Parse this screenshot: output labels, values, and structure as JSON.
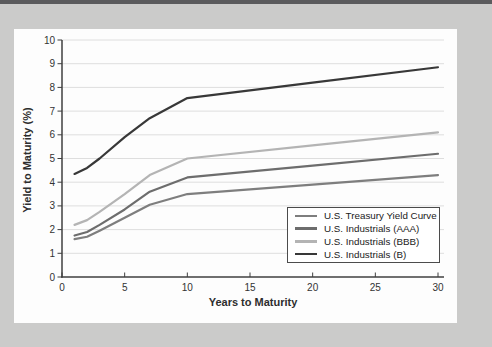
{
  "page": {
    "top_bar_color": "#5b5b5d",
    "background_color": "#cbcbca",
    "panel_color": "#fdfdfd"
  },
  "chart_data": {
    "type": "line",
    "xlabel": "Years to Maturity",
    "ylabel": "Yield to Maturity (%)",
    "xlim": [
      0,
      30
    ],
    "ylim": [
      0,
      10
    ],
    "xticks": [
      0,
      5,
      10,
      15,
      20,
      25,
      30
    ],
    "yticks": [
      0,
      1,
      2,
      3,
      4,
      5,
      6,
      7,
      8,
      9,
      10
    ],
    "grid": "horizontal-only",
    "grid_color": "#dedede",
    "axis_color": "#3f3f3f",
    "tick_label_color": "#333333",
    "legend_position": "inside-lower-right",
    "x": [
      1,
      2,
      3,
      5,
      7,
      10,
      20,
      30
    ],
    "series": [
      {
        "name": "U.S. Treasury Yield Curve",
        "color": "#7e7e7e",
        "values": [
          1.6,
          1.7,
          1.95,
          2.5,
          3.05,
          3.5,
          3.9,
          4.3
        ]
      },
      {
        "name": "U.S. Industrials (AAA)",
        "color": "#6d6d6d",
        "values": [
          1.75,
          1.9,
          2.2,
          2.85,
          3.6,
          4.2,
          4.7,
          5.2
        ]
      },
      {
        "name": "U.S. Industrials (BBB)",
        "color": "#b4b4b4",
        "values": [
          2.2,
          2.4,
          2.75,
          3.5,
          4.3,
          5.0,
          5.55,
          6.1
        ]
      },
      {
        "name": "U.S. Industrials (B)",
        "color": "#383838",
        "values": [
          4.35,
          4.6,
          5.0,
          5.9,
          6.7,
          7.55,
          8.2,
          8.85
        ]
      }
    ]
  }
}
